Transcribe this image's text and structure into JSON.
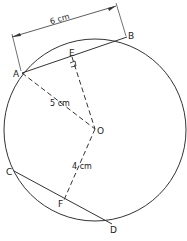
{
  "diagram": {
    "type": "circle-geometry",
    "points": {
      "A": {
        "label": "A"
      },
      "B": {
        "label": "B"
      },
      "C": {
        "label": "C"
      },
      "D": {
        "label": "D"
      },
      "E": {
        "label": "E"
      },
      "F": {
        "label": "F"
      },
      "O": {
        "label": "O"
      }
    },
    "measurements": {
      "AB": "6 cm",
      "OA": "5 cm",
      "OF": "4 cm"
    },
    "annotations": {
      "right_angle_at": "E"
    }
  }
}
